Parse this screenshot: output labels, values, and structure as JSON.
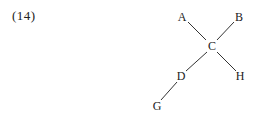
{
  "example_number": "(14)",
  "diagram": {
    "type": "tree",
    "nodes": [
      {
        "id": "A",
        "label": "A",
        "x": 182,
        "y": 17
      },
      {
        "id": "B",
        "label": "B",
        "x": 239,
        "y": 17
      },
      {
        "id": "C",
        "label": "C",
        "x": 212,
        "y": 46
      },
      {
        "id": "D",
        "label": "D",
        "x": 181,
        "y": 76
      },
      {
        "id": "H",
        "label": "H",
        "x": 240,
        "y": 76
      },
      {
        "id": "G",
        "label": "G",
        "x": 157,
        "y": 106
      }
    ],
    "edges": [
      {
        "from": "A",
        "to": "C"
      },
      {
        "from": "B",
        "to": "C"
      },
      {
        "from": "C",
        "to": "D"
      },
      {
        "from": "C",
        "to": "H"
      },
      {
        "from": "D",
        "to": "G"
      }
    ],
    "line_color": "#333333"
  }
}
